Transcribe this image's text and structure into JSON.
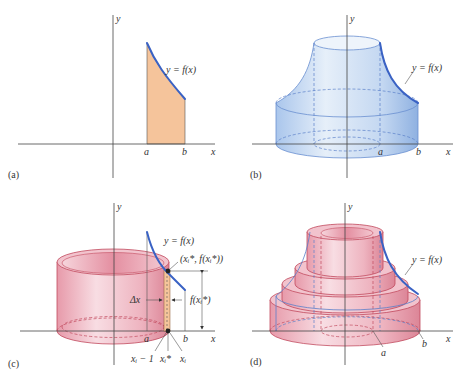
{
  "figure": {
    "panels": [
      {
        "id": "a",
        "caption": "(a)",
        "description": "Region under y = f(x) between x = a and x = b",
        "labels": {
          "y_axis": "y",
          "x_axis": "x",
          "curve": "y = f(x)",
          "a": "a",
          "b": "b"
        },
        "colors": {
          "region_fill": "#f5c49b",
          "curve": "#3a62c4"
        }
      },
      {
        "id": "b",
        "caption": "(b)",
        "description": "Solid of revolution obtained by rotating the region about the y-axis",
        "labels": {
          "y_axis": "y",
          "x_axis": "x",
          "curve": "y = f(x)",
          "a": "a",
          "b": "b"
        },
        "colors": {
          "solid_fill": "#c9dcf3",
          "curve": "#3a62c4"
        }
      },
      {
        "id": "c",
        "caption": "(c)",
        "description": "Single cylindrical shell from rotating a thin rectangle of width Δx",
        "labels": {
          "y_axis": "y",
          "x_axis": "x",
          "curve": "y = f(x)",
          "a": "a",
          "b": "b",
          "point": "(xᵢ*, f(xᵢ*))",
          "delta_x": "Δx",
          "height": "f(xᵢ*)",
          "x_prev": "xᵢ − 1",
          "x_star": "xᵢ*",
          "x_i": "xᵢ"
        },
        "colors": {
          "shell_fill": "#efb7c2",
          "strip_fill": "#f5c49b",
          "curve": "#3a62c4"
        }
      },
      {
        "id": "d",
        "caption": "(d)",
        "description": "Approximation of the solid by a stack of cylindrical shells",
        "labels": {
          "y_axis": "y",
          "x_axis": "x",
          "curve": "y = f(x)",
          "a": "a",
          "b": "b"
        },
        "colors": {
          "shell_fill": "#efb7c2",
          "curve": "#3a62c4"
        }
      }
    ]
  }
}
